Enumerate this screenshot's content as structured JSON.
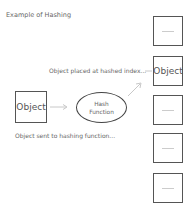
{
  "title": "Example of Hashing",
  "source_object": {
    "label": "Object"
  },
  "hash_function": {
    "line1": "Hash",
    "line2": "Function"
  },
  "captions": {
    "sent": "Object sent to hashing function...",
    "placed": "Object placed at hashed index..."
  },
  "slots": [
    {
      "label": ""
    },
    {
      "label": "Object"
    },
    {
      "label": ""
    },
    {
      "label": ""
    },
    {
      "label": ""
    }
  ],
  "colors": {
    "border": "#555555",
    "arrow": "#c8c8c8",
    "text": "#666666"
  }
}
